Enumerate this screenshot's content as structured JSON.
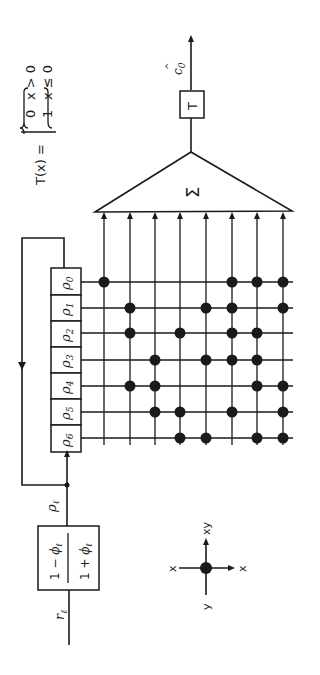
{
  "diagram": {
    "orientation": "rotated 90 degrees counter-clockwise",
    "threshold_def": {
      "lhs": "T(x) =",
      "case_a_value": "0",
      "case_a_cond": "x > 0",
      "case_b_value": "1",
      "case_b_cond": "x ≤ 0"
    },
    "output_label": "ĉ₀",
    "output_label_base": "c",
    "output_label_sub": "0",
    "output_label_hat": "^",
    "threshold_block": "T",
    "summer_symbol": "Σ",
    "register_cells": [
      "ρ0",
      "ρ1",
      "ρ2",
      "ρ3",
      "ρ4",
      "ρ5",
      "ρ6"
    ],
    "register_greek": "ρ",
    "register_subs": [
      "0",
      "1",
      "2",
      "3",
      "4",
      "5",
      "6"
    ],
    "input_label_greek": "ρ",
    "input_label_sub": "ℓ",
    "transform_block": {
      "top_left": "1 −",
      "top_phi": "ϕ",
      "sub": "ℓ",
      "bottom_left": "1 +",
      "bottom_phi": "ϕ"
    },
    "source_label": "r",
    "source_sub": "ℓ",
    "legend": {
      "left": "x",
      "right": "x",
      "top": "xy",
      "bottom": "y"
    },
    "connection_matrix": {
      "rows": [
        "ρ0",
        "ρ1",
        "ρ2",
        "ρ3",
        "ρ4",
        "ρ5",
        "ρ6"
      ],
      "columns": 8,
      "dots": [
        [
          1,
          0,
          0,
          0,
          0,
          1,
          1,
          1
        ],
        [
          0,
          1,
          0,
          0,
          1,
          1,
          0,
          1
        ],
        [
          0,
          1,
          0,
          1,
          0,
          1,
          1,
          0
        ],
        [
          0,
          0,
          1,
          0,
          1,
          1,
          1,
          0
        ],
        [
          0,
          1,
          1,
          0,
          0,
          0,
          1,
          1
        ],
        [
          0,
          0,
          1,
          1,
          0,
          1,
          0,
          1
        ],
        [
          0,
          0,
          0,
          1,
          1,
          0,
          1,
          1
        ]
      ]
    },
    "colors": {
      "ink": "#1a1a1a",
      "paper": "#ffffff"
    }
  }
}
